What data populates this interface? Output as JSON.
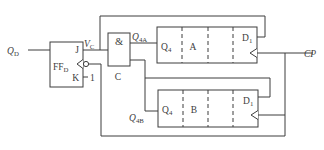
{
  "diagram": {
    "colors": {
      "line": "#3d3d3d",
      "background": "#ffffff"
    },
    "inputs": {
      "qd": {
        "main": "Q",
        "sub": "D"
      },
      "cp": "CP",
      "k_const": "1"
    },
    "flip_flop": {
      "j_label": "J",
      "k_label": "K",
      "name_main": "FF",
      "name_sub": "D"
    },
    "and_gate": {
      "symbol": "&",
      "name": "C"
    },
    "signals": {
      "vc": {
        "main": "V",
        "sub": "C"
      },
      "q4a": {
        "main": "Q",
        "sub": "4A"
      },
      "q4b": {
        "main": "Q",
        "sub": "4B"
      }
    },
    "register_a": {
      "q_label": {
        "main": "Q",
        "sub": "4"
      },
      "name": "A",
      "d_label": {
        "main": "D",
        "sub": "1"
      }
    },
    "register_b": {
      "q_label": {
        "main": "Q",
        "sub": "4"
      },
      "name": "B",
      "d_label": {
        "main": "D",
        "sub": "1"
      }
    }
  }
}
